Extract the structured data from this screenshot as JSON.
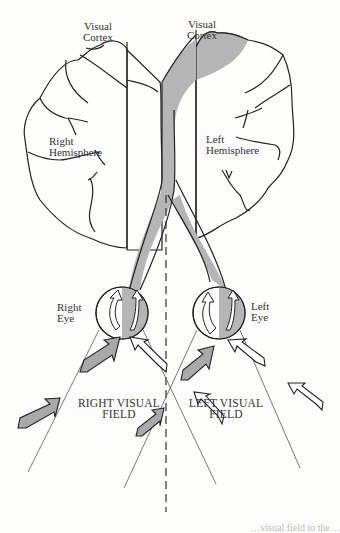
{
  "diagram": {
    "colors": {
      "background": "#fdfdfb",
      "outline": "#222222",
      "shading": "#b5b5b5",
      "field_lines": "#555555",
      "label_text": "#333333"
    },
    "labels": {
      "visual_cortex_right": [
        "Visual",
        "Cortex"
      ],
      "visual_cortex_left": [
        "Visual",
        "Cortex"
      ],
      "right_hemisphere": [
        "Right",
        "Hemisphere"
      ],
      "left_hemisphere": [
        "Left",
        "Hemisphere"
      ],
      "right_eye": [
        "Right",
        "Eye"
      ],
      "left_eye": [
        "Left",
        "Eye"
      ],
      "right_visual_field": [
        "RIGHT VISUAL",
        "FIELD"
      ],
      "left_visual_field": [
        "LEFT VISUAL",
        "FIELD"
      ]
    },
    "structures": [
      {
        "name": "right-hemisphere",
        "shaded": false
      },
      {
        "name": "left-hemisphere",
        "shaded": "occipital region (visual cortex)"
      },
      {
        "name": "right-eye",
        "shaded": "right half of retina"
      },
      {
        "name": "left-eye",
        "shaded": "right half of retina"
      },
      {
        "name": "optic-pathway",
        "shaded": "pathway from right halves of both retinas to left hemisphere"
      },
      {
        "name": "midline",
        "style": "dashed vertical line"
      }
    ],
    "arrows": {
      "right_visual_field": {
        "fill": "gray",
        "count": 3
      },
      "left_visual_field": {
        "fill": "white",
        "count": 4
      }
    },
    "caption": "…visual field to the…"
  }
}
